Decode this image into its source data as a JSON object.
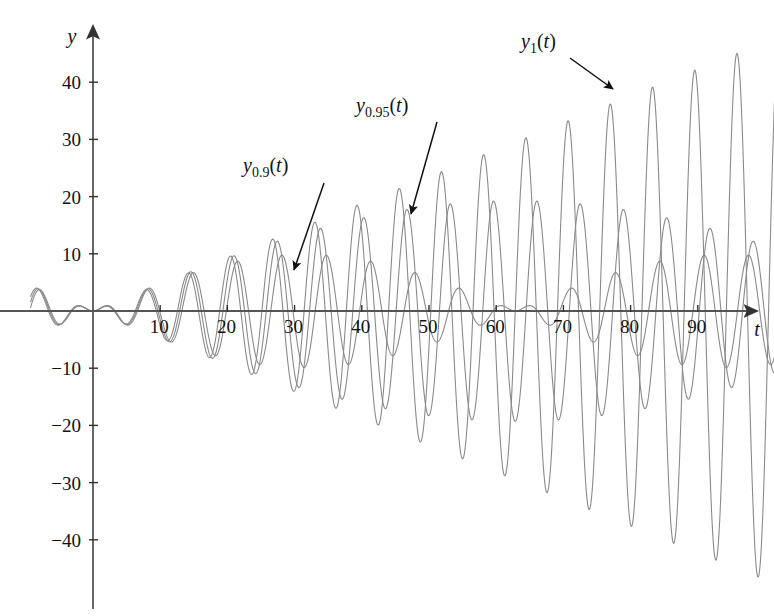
{
  "figure": {
    "background": "#ffffff",
    "curve_color": "#808080",
    "axis_color": "#555555",
    "text_color": "#111111"
  },
  "axes": {
    "x_axis_name": "t",
    "y_axis_name": "y",
    "x_ticks": [
      10,
      20,
      30,
      40,
      50,
      60,
      70,
      80,
      90
    ],
    "x_tick_labels": [
      "10",
      "20",
      "30",
      "40",
      "50",
      "60",
      "70",
      "80",
      "90"
    ],
    "y_ticks": [
      40,
      30,
      20,
      10,
      -10,
      -20,
      -30,
      -40
    ],
    "y_tick_labels": [
      "40",
      "30",
      "20",
      "10",
      "−10",
      "−20",
      "−30",
      "−40"
    ]
  },
  "annotations": [
    {
      "name": "label-y09",
      "base": "y",
      "sub": "0.9",
      "arg": "(t)",
      "text": "y0.9(t)",
      "label_x": 243,
      "label_y": 172,
      "arrow_from": [
        324,
        183
      ],
      "arrow_to": [
        294,
        270
      ]
    },
    {
      "name": "label-y095",
      "base": "y",
      "sub": "0.95",
      "arg": "(t)",
      "text": "y0.95(t)",
      "label_x": 356,
      "label_y": 112,
      "arrow_from": [
        437,
        122
      ],
      "arrow_to": [
        411,
        214
      ]
    },
    {
      "name": "label-y1",
      "base": "y",
      "sub": "1",
      "arg": "(t)",
      "text": "y1(t)",
      "label_x": 521,
      "label_y": 48,
      "arrow_from": [
        570,
        58
      ],
      "arrow_to": [
        613,
        89
      ]
    }
  ],
  "chart_data": {
    "type": "line",
    "title": "",
    "xlabel": "t",
    "ylabel": "y",
    "xlim": [
      -9.5,
      101.5
    ],
    "ylim": [
      -47,
      48
    ],
    "grid": false,
    "legend": "annotated-inline",
    "natural_frequency": 1,
    "x_tick_step": 10,
    "y_tick_step": 10,
    "series": [
      {
        "name": "y0.9(t)",
        "omega": 0.9,
        "envelope": "beat",
        "beat_period": 62.8,
        "peak_amplitude": 16,
        "color": "#808080"
      },
      {
        "name": "y0.95(t)",
        "omega": 0.95,
        "envelope": "beat",
        "beat_period": 125.7,
        "peak_amplitude": 31,
        "color": "#808080"
      },
      {
        "name": "y1(t)",
        "omega": 1,
        "envelope": "linear-growth",
        "growth_rate": 0.47,
        "peak_amplitude": 47,
        "color": "#808080"
      }
    ],
    "sampled_points": {
      "x": [
        0,
        10,
        20,
        30,
        40,
        50,
        60,
        70,
        80,
        90,
        100
      ],
      "y1_envelope": [
        0,
        4.7,
        9.4,
        14.1,
        18.8,
        23.5,
        28.2,
        32.9,
        37.6,
        42.3,
        47
      ],
      "y095_envelope": [
        0,
        4.6,
        9.1,
        13.3,
        17.3,
        20.9,
        24.1,
        26.8,
        28.9,
        30.4,
        31.1
      ],
      "y09_envelope": [
        0,
        4.4,
        8.1,
        11.2,
        13.5,
        15.1,
        15.9,
        15.8,
        14.9,
        13.2,
        10.9
      ]
    }
  }
}
